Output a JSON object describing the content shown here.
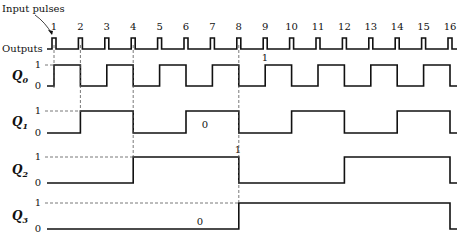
{
  "title_annotation": "Input pulses",
  "outputs_label": "Outputs",
  "pulse_numbers": [
    "1",
    "2",
    "3",
    "4",
    "5",
    "6",
    "7",
    "8",
    "9",
    "10",
    "11",
    "12",
    "13",
    "14",
    "15",
    "16"
  ],
  "signals": [
    {
      "name": "Q",
      "sub": "0",
      "toggle_on": [
        1,
        2,
        3,
        4,
        5,
        6,
        7,
        8,
        9,
        10,
        11,
        12,
        13,
        14,
        15,
        16
      ],
      "annotation": "1"
    },
    {
      "name": "Q",
      "sub": "1",
      "toggle_on": [
        2,
        4,
        6,
        8,
        10,
        12,
        14,
        16
      ],
      "annotation": "0"
    },
    {
      "name": "Q",
      "sub": "2",
      "toggle_on": [
        4,
        8,
        12,
        16
      ],
      "annotation": "1"
    },
    {
      "name": "Q",
      "sub": "3",
      "toggle_on": [
        8,
        16
      ],
      "annotation": "0"
    }
  ],
  "level_labels": {
    "high": "1",
    "low": "0"
  },
  "colors": {
    "ink": "#111111",
    "dash": "#555555",
    "background": "#ffffff"
  }
}
